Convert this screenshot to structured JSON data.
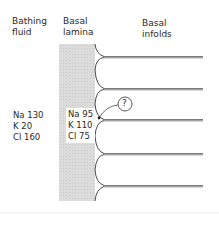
{
  "headers": {
    "bathing_fluid": "Bathing\nfluid",
    "basal_lamina": "Basal\nlamina",
    "basal_infolds": "Basal\ninfolds"
  },
  "bathing_fluid_ions": {
    "na": "Na 130",
    "k": "K 20",
    "cl": "Cl 160"
  },
  "lamina_ions": {
    "na": "Na 95",
    "k": "K 110",
    "cl": "Cl 75"
  },
  "annotation": {
    "symbol": "?"
  },
  "colors": {
    "lamina_fill": "#d9d9d9",
    "line": "#555555"
  }
}
